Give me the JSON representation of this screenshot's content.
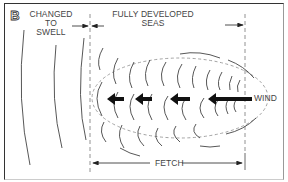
{
  "diagram": {
    "panel_letter": "B",
    "labels": {
      "changed_to_swell": [
        "CHANGED TO",
        "SWELL"
      ],
      "fully_developed_seas": [
        "FULLY DEVELOPED",
        "SEAS"
      ],
      "wind": "WIND",
      "fetch": "FETCH"
    },
    "colors": {
      "line": "#333333",
      "dashed": "#888888",
      "text": "#444444",
      "background": "#ffffff"
    },
    "arrows": {
      "wave_direction_count": 4,
      "direction": "left"
    }
  }
}
